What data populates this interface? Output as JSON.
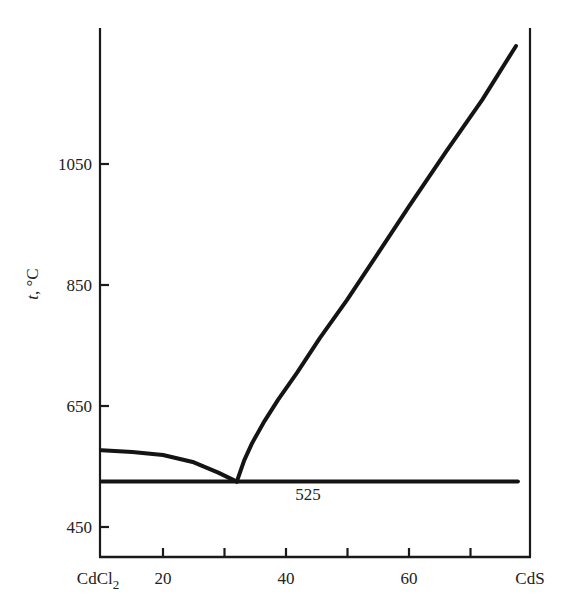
{
  "chart_data": {
    "type": "line",
    "title": "",
    "xlabel": "",
    "ylabel": "t, °C",
    "ylabel_italic_part": "t",
    "ylabel_rest": ", °C",
    "x_end_labels": {
      "left": "CdCl",
      "left_sub": "2",
      "right": "CdS"
    },
    "xticks": [
      {
        "value": 20,
        "label": "20"
      },
      {
        "value": 30,
        "label": ""
      },
      {
        "value": 40,
        "label": "40"
      },
      {
        "value": 50,
        "label": ""
      },
      {
        "value": 60,
        "label": "60"
      },
      {
        "value": 70,
        "label": ""
      }
    ],
    "yticks": [
      {
        "value": 450,
        "label": "450"
      },
      {
        "value": 650,
        "label": "650"
      },
      {
        "value": 850,
        "label": "850"
      },
      {
        "value": 1050,
        "label": "1050"
      }
    ],
    "xlim": [
      10,
      80
    ],
    "ylim": [
      400,
      1300
    ],
    "grid": false,
    "legend": null,
    "series": [
      {
        "name": "liquidus CdCl2 side",
        "points": [
          [
            10,
            577
          ],
          [
            15,
            574
          ],
          [
            20,
            569
          ],
          [
            25,
            557
          ],
          [
            29,
            540
          ],
          [
            32,
            525
          ]
        ]
      },
      {
        "name": "liquidus CdS side",
        "points": [
          [
            32,
            525
          ],
          [
            33.2,
            560
          ],
          [
            34.5,
            589
          ],
          [
            36.5,
            625
          ],
          [
            38.7,
            660
          ],
          [
            41.8,
            705
          ],
          [
            45.5,
            762
          ],
          [
            49.9,
            825
          ],
          [
            55,
            903
          ],
          [
            60,
            980
          ],
          [
            66,
            1070
          ],
          [
            71.9,
            1156
          ],
          [
            77.4,
            1245
          ]
        ]
      },
      {
        "name": "eutectic horizontal",
        "points": [
          [
            10,
            525
          ],
          [
            77.7,
            525
          ]
        ]
      }
    ],
    "annotations": [
      {
        "text": "525",
        "x": 43,
        "y": 497
      }
    ],
    "eutectic": {
      "composition": 32,
      "temperature": 525
    }
  }
}
